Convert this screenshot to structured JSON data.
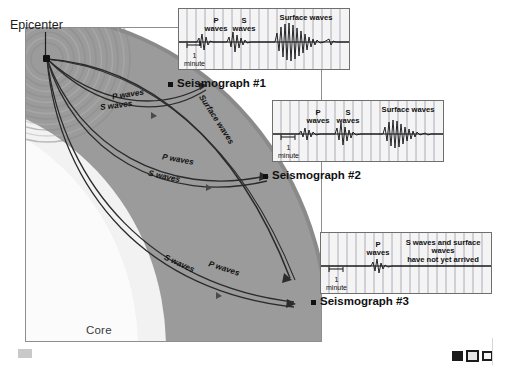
{
  "diagram": {
    "epicenter_label": "Epicenter",
    "interior_labels": {
      "core": "Core",
      "mantle": "Mantle"
    },
    "colors": {
      "mantle": "#9b9b9b",
      "crust": "#8a8a8a",
      "core": "#f2f2f2",
      "panel_background": "#f4f4f4",
      "panel_border": "#6f6f6f",
      "trace": "#111111",
      "page_background": "#ffffff"
    },
    "wave_path_labels": [
      {
        "id": "path1-p",
        "text": "P waves"
      },
      {
        "id": "path1-s",
        "text": "S waves"
      },
      {
        "id": "surface",
        "text": "Surface waves"
      },
      {
        "id": "path2-p",
        "text": "P waves"
      },
      {
        "id": "path2-s",
        "text": "S waves"
      },
      {
        "id": "path3-s",
        "text": "S waves"
      },
      {
        "id": "path3-p",
        "text": "P waves"
      }
    ]
  },
  "seismographs": [
    {
      "name": "Seismograph #1",
      "scale_value": "1",
      "scale_unit": "minute",
      "annotations": [
        {
          "text": "P\nwaves"
        },
        {
          "text": "S\nwaves"
        },
        {
          "text": "Surface waves"
        }
      ]
    },
    {
      "name": "Seismograph #2",
      "scale_value": "1",
      "scale_unit": "minute",
      "annotations": [
        {
          "text": "P\nwaves"
        },
        {
          "text": "S\nwaves"
        },
        {
          "text": "Surface waves"
        }
      ]
    },
    {
      "name": "Seismograph #3",
      "scale_value": "1",
      "scale_unit": "minute",
      "annotations": [
        {
          "text": "P\nwaves"
        },
        {
          "text": "S waves and surface waves\nhave not yet arrived"
        }
      ]
    }
  ]
}
